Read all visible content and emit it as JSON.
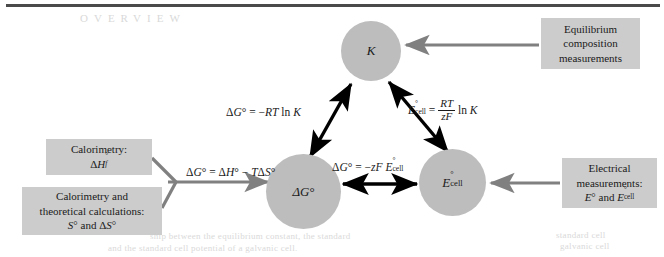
{
  "figure": {
    "colors": {
      "node_fill": "#bdbdbd",
      "box_fill": "#cccccc",
      "black_arrow": "#000000",
      "gray_arrow": "#808080",
      "rule": "#4a4a4a",
      "background": "#ffffff"
    }
  },
  "nodes": [
    {
      "id": "K",
      "label": "K",
      "name": "equilibrium-constant-node"
    },
    {
      "id": "dG",
      "label": "ΔG°",
      "name": "gibbs-energy-node"
    },
    {
      "id": "Ecell",
      "label": "E°cell",
      "name": "cell-potential-node"
    }
  ],
  "boxes": {
    "calorimetry": {
      "line1": "Calorimetry:",
      "line2": "ΔH°f"
    },
    "theoretical": {
      "line1": "Calorimetry and",
      "line2": "theoretical calculations:",
      "line3": "S° and ΔS°"
    },
    "equilibrium": {
      "line1": "Equilibrium",
      "line2": "composition",
      "line3": "measurements"
    },
    "electrical": {
      "line1": "Electrical",
      "line2": "measurements:",
      "line3": "E° and E°cell"
    }
  },
  "equations": {
    "gibbs_from_enthalpy": "ΔG° = ΔH° − TΔS°",
    "gibbs_from_k": "ΔG° = −RT ln K",
    "gibbs_from_ecell": "ΔG° = −zF E°cell",
    "ecell_from_k": "E°cell = (RT/zF) ln K"
  },
  "ghost_text": {
    "g1": "ship between the equilibrium constant, the standard",
    "g2": "and the standard cell potential of a galvanic cell.",
    "g3": "standard cell",
    "g4": "galvanic cell",
    "g5": "OVERVIEW"
  }
}
